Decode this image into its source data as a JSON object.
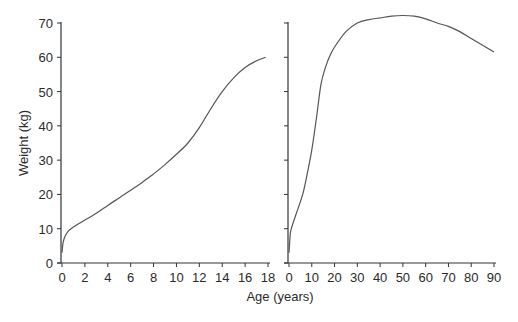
{
  "chart_data": [
    {
      "type": "line",
      "title": "",
      "xlabel": "Age (years)",
      "ylabel": "Weight (kg)",
      "xlim": [
        0,
        18
      ],
      "ylim": [
        0,
        70
      ],
      "xticks": [
        0,
        2,
        4,
        6,
        8,
        10,
        12,
        14,
        16,
        18
      ],
      "yticks": [
        0,
        10,
        20,
        30,
        40,
        50,
        60,
        70
      ],
      "grid": false,
      "legend": null,
      "series": [
        {
          "name": "Weight (ages 0-18)",
          "x": [
            0,
            0.1,
            0.3,
            0.6,
            1,
            2,
            3,
            4,
            5,
            6,
            7,
            8,
            9,
            10,
            11,
            12,
            13,
            14,
            15,
            16,
            17,
            17.8
          ],
          "y": [
            3,
            6,
            8,
            9.5,
            10.5,
            12.5,
            14.5,
            16.8,
            19,
            21.2,
            23.5,
            26,
            28.7,
            31.7,
            35,
            39.5,
            45,
            50,
            54,
            57,
            59,
            60
          ]
        }
      ]
    },
    {
      "type": "line",
      "title": "",
      "xlabel": "Age (years)",
      "ylabel": "Weight (kg)",
      "xlim": [
        0,
        90
      ],
      "ylim": [
        0,
        70
      ],
      "xticks": [
        0,
        10,
        20,
        30,
        40,
        50,
        60,
        70,
        80,
        90
      ],
      "yticks": [
        0,
        10,
        20,
        30,
        40,
        50,
        60,
        70
      ],
      "grid": false,
      "legend": null,
      "series": [
        {
          "name": "Weight (ages 0-90)",
          "x": [
            0,
            0.5,
            1,
            3,
            6,
            8,
            10,
            12,
            14,
            16,
            18,
            20,
            25,
            30,
            35,
            40,
            45,
            50,
            55,
            60,
            65,
            70,
            75,
            80,
            85,
            90
          ],
          "y": [
            3,
            8,
            10,
            14,
            20,
            26,
            33,
            42,
            52,
            57,
            60.5,
            63,
            67.5,
            70,
            71,
            71.5,
            72,
            72.2,
            72,
            71.2,
            70,
            69,
            67.5,
            65.5,
            63.5,
            61.5
          ]
        }
      ]
    }
  ],
  "labels": {
    "ylabel": "Weight (kg)",
    "xlabel": "Age (years)"
  },
  "colors": {
    "line": "#555555",
    "axis": "#333333",
    "text": "#2a2a2a"
  }
}
